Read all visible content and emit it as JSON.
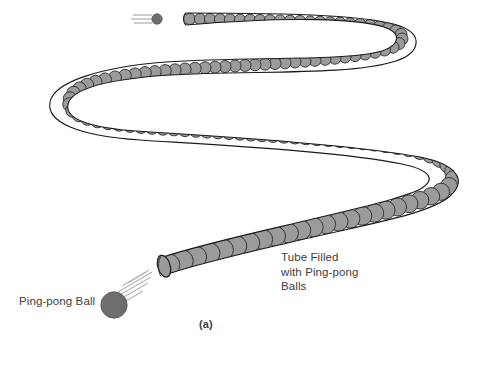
{
  "figure": {
    "caption": "(a)",
    "background_color": "#ffffff",
    "ink_color": "#404040",
    "ball_fill_color": "#9b9b9b",
    "ball_stroke_color": "#2b2b2b",
    "moving_ball_color": "#6e6e6e",
    "tube_outline_color": "#1a1a1a",
    "labels": {
      "tube": "Tube Filled\nwith Ping-pong\nBalls",
      "tube_line1": "Tube Filled",
      "tube_line2": "with Ping-pong",
      "tube_line3": "Balls",
      "ball": "Ping-pong Ball"
    },
    "icons": {
      "incoming_ball": "ping-pong-ball-icon",
      "motion_lines": "motion-lines-icon",
      "tube_opening": "tube-open-end-icon"
    },
    "diagram_description": "Serpentine S-shaped tube filled with ping-pong balls; a ping-pong ball with motion lines approaches the lower-left open end, and another ball with motion lines exits at the upper-left end of the tube."
  }
}
